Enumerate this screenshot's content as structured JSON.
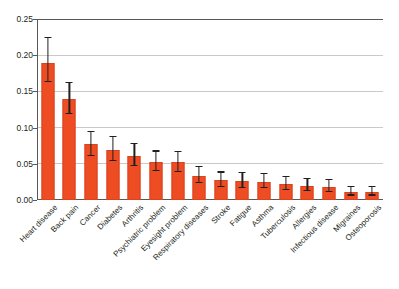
{
  "chart_data": {
    "type": "bar",
    "title": "",
    "subtitle": "",
    "xlabel": "",
    "ylabel": "",
    "ylim": [
      0.0,
      0.25
    ],
    "ytick_labels": [
      "0.25",
      "0.20",
      "0.15",
      "0.10",
      "0.05",
      "0.00"
    ],
    "ytick_values": [
      0.25,
      0.2,
      0.15,
      0.1,
      0.05,
      0.0
    ],
    "grid": "horizontal",
    "legend": "none",
    "bar_color": "#ee4d24",
    "error_bar_color": "#231f20",
    "axis_color": "#58585a",
    "gridline_color": "#c9c9c9",
    "background_color": "#ffffff",
    "categories": [
      "Heart disease",
      "Back pain",
      "Cancer",
      "Diabetes",
      "Arthritis",
      "Psychiatric problem",
      "Eyesight problem",
      "Respiratory diseases",
      "Stroke",
      "Fatigue",
      "Asthma",
      "Tuberculosis",
      "Allergies",
      "Infectious disease",
      "Migraines",
      "Osteoporosis"
    ],
    "values": [
      0.189,
      0.14,
      0.077,
      0.069,
      0.061,
      0.053,
      0.052,
      0.033,
      0.027,
      0.026,
      0.025,
      0.022,
      0.019,
      0.018,
      0.011,
      0.011
    ],
    "error_upper": [
      0.224,
      0.161,
      0.094,
      0.087,
      0.077,
      0.067,
      0.066,
      0.045,
      0.038,
      0.037,
      0.036,
      0.032,
      0.029,
      0.027,
      0.018,
      0.018
    ],
    "error_lower": [
      0.163,
      0.119,
      0.061,
      0.054,
      0.047,
      0.04,
      0.039,
      0.023,
      0.018,
      0.017,
      0.016,
      0.014,
      0.012,
      0.011,
      0.006,
      0.006
    ]
  }
}
